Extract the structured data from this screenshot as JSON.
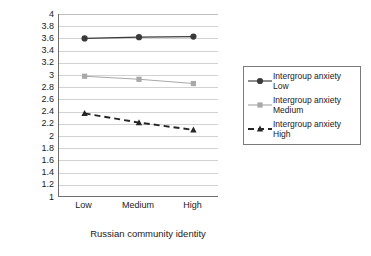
{
  "chart_data": {
    "type": "line",
    "title": "",
    "xlabel": "Russian community identity",
    "ylabel": "",
    "categories": [
      "Low",
      "Medium",
      "High"
    ],
    "ylim": [
      1,
      4
    ],
    "ytick_step": 0.2,
    "yticks": [
      "4",
      "3.8",
      "3.6",
      "3.4",
      "3.2",
      "3",
      "2.8",
      "2.6",
      "2.4",
      "2.2",
      "2",
      "1.8",
      "1.6",
      "1.4",
      "1.2",
      "1"
    ],
    "grid": true,
    "legend_position": "right",
    "series": [
      {
        "name": "Intergroup anxiety Low",
        "name_line1": "Intergroup anxiety",
        "name_line2": "Low",
        "values": [
          3.6,
          3.62,
          3.63
        ],
        "color": "#3a3a3a",
        "marker": "circle",
        "dash": "solid"
      },
      {
        "name": "Intergroup anxiety Medium",
        "name_line1": "Intergroup anxiety",
        "name_line2": "Medium",
        "values": [
          2.98,
          2.93,
          2.86
        ],
        "color": "#a8a8a8",
        "marker": "square",
        "dash": "solid"
      },
      {
        "name": "Intergroup anxiety High",
        "name_line1": "Intergroup anxiety",
        "name_line2": "High",
        "values": [
          2.37,
          2.22,
          2.1
        ],
        "color": "#262626",
        "marker": "triangle",
        "dash": "dashed"
      }
    ]
  }
}
